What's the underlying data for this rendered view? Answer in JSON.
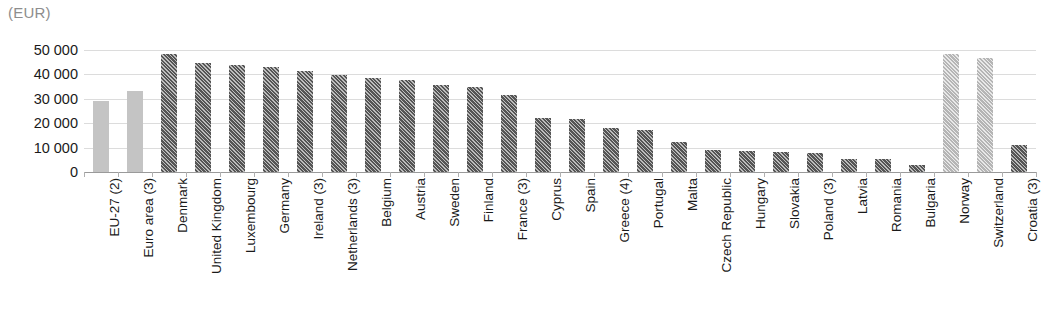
{
  "chart_data": {
    "type": "bar",
    "title": "",
    "subtitle": "",
    "unit_label": "(EUR)",
    "xlabel": "",
    "ylabel": "",
    "ylim": [
      0,
      50000
    ],
    "grid": true,
    "legend_position": "none",
    "ytick_labels": [
      "50 000",
      "40 000",
      "30 000",
      "20 000",
      "10 000",
      "0"
    ],
    "ytick_values": [
      50000,
      40000,
      30000,
      20000,
      10000,
      0
    ],
    "categories": [
      "EU-27 (2)",
      "Euro area (3)",
      "Denmark",
      "United Kingdom",
      "Luxembourg",
      "Germany",
      "Ireland (3)",
      "Netherlands (3)",
      "Belgium",
      "Austria",
      "Sweden",
      "Finland",
      "France (3)",
      "Cyprus",
      "Spain",
      "Greece (4)",
      "Portugal",
      "Malta",
      "Czech Republic",
      "Hungary",
      "Slovakia",
      "Poland (3)",
      "Latvia",
      "Romania",
      "Bulgaria",
      "Norway",
      "Switzerland",
      "Croatia (3)"
    ],
    "values": [
      29300,
      33400,
      48500,
      44600,
      44000,
      43000,
      41200,
      39600,
      38600,
      37800,
      35800,
      35000,
      31400,
      22200,
      21900,
      17900,
      17300,
      12500,
      9200,
      8800,
      8000,
      7700,
      5500,
      5300,
      3000,
      48300,
      46900,
      11200
    ],
    "bar_styles": [
      "light-solid",
      "light-solid",
      "dark",
      "dark",
      "dark",
      "dark",
      "dark",
      "dark",
      "dark",
      "dark",
      "dark",
      "dark",
      "dark",
      "dark",
      "dark",
      "dark",
      "dark",
      "dark",
      "dark",
      "dark",
      "dark",
      "dark",
      "dark",
      "dark",
      "dark",
      "light-hatch",
      "light-hatch",
      "dark"
    ],
    "colors": {
      "bar_dark": "#555555",
      "bar_light_solid": "#c4c4c4",
      "bar_light_hatch": "#b5b5b5",
      "gridline": "#dcdcdc",
      "axis": "#9a9a9a",
      "text": "#1a1a1a",
      "unit_text": "#8d8d8d"
    }
  }
}
